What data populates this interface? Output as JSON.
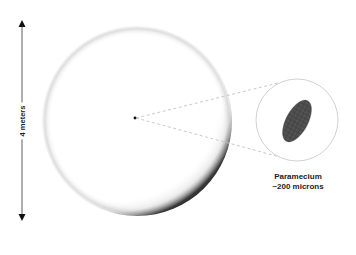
{
  "scale": {
    "label": "4 meters",
    "color": "#1a1a1a"
  },
  "sphere": {
    "description": "large sphere with center point",
    "center_dot_color": "#111111"
  },
  "inset": {
    "caption_line1": "Paramecium",
    "caption_line2": "~200 microns",
    "organism_color": "#4a4a4a",
    "circle_color": "#bbbbbb"
  },
  "connector": {
    "style": "dashed",
    "color": "#c8c8c8"
  }
}
